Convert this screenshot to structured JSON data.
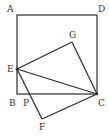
{
  "diagram": {
    "type": "geometry",
    "colors": {
      "stroke": "#2a2a2a",
      "label": "#333333",
      "background": "#ffffff"
    },
    "points": {
      "A": {
        "label": "A",
        "x": 17,
        "y": 15
      },
      "B": {
        "label": "B",
        "x": 17,
        "y": 94
      },
      "C": {
        "label": "C",
        "x": 97,
        "y": 94
      },
      "D": {
        "label": "D",
        "x": 97,
        "y": 15
      },
      "E": {
        "label": "E",
        "x": 17,
        "y": 69
      },
      "G": {
        "label": "G",
        "x": 72,
        "y": 42
      },
      "P": {
        "label": "P",
        "x": 27,
        "y": 94
      },
      "F": {
        "label": "F",
        "x": 42,
        "y": 119
      }
    },
    "segments": [
      [
        "A",
        "B"
      ],
      [
        "B",
        "C"
      ],
      [
        "C",
        "D"
      ],
      [
        "D",
        "A"
      ],
      [
        "E",
        "G"
      ],
      [
        "G",
        "C"
      ],
      [
        "E",
        "C"
      ],
      [
        "E",
        "F"
      ],
      [
        "F",
        "C"
      ]
    ]
  }
}
